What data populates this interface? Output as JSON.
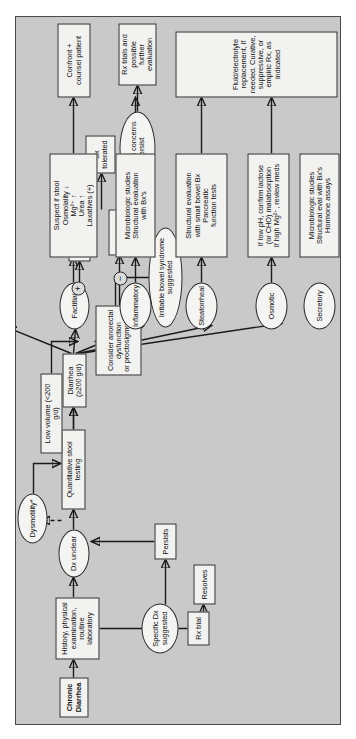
{
  "figure": {
    "kind": "clinical-algorithm-flowchart",
    "orientation": "rotated-90-ccw",
    "background_color": "#c9c9c9",
    "node_fill_color": "#f2f2f0",
    "line_color": "#1b1b1b"
  },
  "nodes": {
    "chronic_diarrhea": "Chronic Diarrhea",
    "history": "History, physical examination,\nroutine laboratory",
    "specific_dx": "Specific Dx\nsuggested",
    "ibs": "Irritable bowel syndrome\nsuggested",
    "dx_unclear": "Dx unclear",
    "rx_trial": "Rx trial",
    "resolves": "Resolves",
    "persists": "Persists",
    "quantitative": "Quantitative stool testing",
    "dysmotility": "Dysmotility*",
    "low_volume": "Low volume (<200 g/d)",
    "diarrhea_200": "Diarrhea (≥200 g/d)",
    "consider_anorectal": "Consider  anorectal\ndysfunction\nor proctosigmoiditis",
    "rx": "Rx",
    "reassure": "Reassure + educate",
    "sx_tolerated": "Sx\ntolerated",
    "sx_persist": "Sx and concerns\npersist",
    "rx_trials": "Rx trials and possible\nfurther evaluation",
    "factitial": "Factitial",
    "suspect_stool": "Suspect if stool\nOsmolality ↓\nMg²⁺ ↑\nUrea ↑\nLaxatives (+)",
    "confront": "Confront +\ncounsel patient",
    "inflammatory": "Inflammatory",
    "micro_bx": "Microbiologic studies\nStructural evaluation\nwith Bx's",
    "steatorrheal": "Steatorrheal",
    "structural_eval": "Structural evaluation\nwith small bowel Bx\nPancreatic\nfunction tests",
    "osmotic": "Osmotic",
    "low_ph": "If low pH, confirm lactose\n(or CHO) malabsorption\nIf high Mg²⁺, review meds",
    "secretory": "Secretory",
    "micro_hormone": "Microbiologic studies\nStructural eval with Bx's\nHormone assays",
    "fluid_replacement": "Fluid/electrolyte replacement, if needed. Curative, suppressive, or empiric Rx, as indicated"
  },
  "signs": {
    "plus": "+",
    "minus": "−"
  }
}
